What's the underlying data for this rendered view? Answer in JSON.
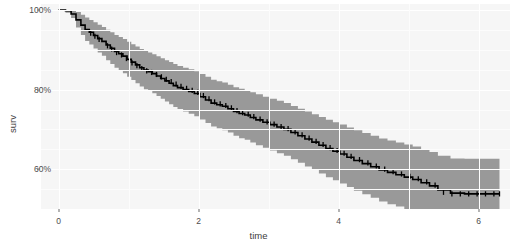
{
  "chart_data": {
    "type": "line",
    "subtype": "kaplan-meier-step-with-confidence-band",
    "title": "",
    "xlabel": "time",
    "ylabel": "surv",
    "xlim": [
      -0.25,
      6.45
    ],
    "ylim": [
      0.5,
      1.015
    ],
    "grid": true,
    "legend": null,
    "x_ticks": [
      0,
      2,
      4,
      6
    ],
    "x_tick_labels": [
      "0",
      "2",
      "4",
      "6"
    ],
    "y_ticks": [
      0.6,
      0.8,
      1.0
    ],
    "y_tick_labels": [
      "60%",
      "80%",
      "100%"
    ],
    "series": [
      {
        "name": "surv",
        "style": "step",
        "color": "#000000",
        "x": [
          0.0,
          0.1,
          0.18,
          0.25,
          0.32,
          0.38,
          0.44,
          0.5,
          0.56,
          0.62,
          0.68,
          0.74,
          0.8,
          0.86,
          0.92,
          0.98,
          1.04,
          1.1,
          1.16,
          1.22,
          1.28,
          1.34,
          1.4,
          1.46,
          1.52,
          1.58,
          1.64,
          1.7,
          1.78,
          1.86,
          1.94,
          2.02,
          2.1,
          2.18,
          2.26,
          2.34,
          2.42,
          2.5,
          2.58,
          2.66,
          2.74,
          2.82,
          2.92,
          3.02,
          3.12,
          3.22,
          3.32,
          3.42,
          3.52,
          3.62,
          3.72,
          3.82,
          3.92,
          4.02,
          4.12,
          4.22,
          4.34,
          4.46,
          4.58,
          4.7,
          4.82,
          4.94,
          5.06,
          5.18,
          5.3,
          5.42,
          5.6,
          5.8,
          6.0,
          6.2,
          6.3
        ],
        "y": [
          1.0,
          0.998,
          0.99,
          0.975,
          0.962,
          0.951,
          0.944,
          0.936,
          0.928,
          0.921,
          0.912,
          0.904,
          0.896,
          0.89,
          0.884,
          0.876,
          0.869,
          0.862,
          0.855,
          0.849,
          0.845,
          0.84,
          0.834,
          0.828,
          0.822,
          0.816,
          0.81,
          0.805,
          0.8,
          0.795,
          0.79,
          0.782,
          0.774,
          0.766,
          0.762,
          0.758,
          0.752,
          0.745,
          0.74,
          0.736,
          0.73,
          0.724,
          0.718,
          0.712,
          0.706,
          0.7,
          0.692,
          0.684,
          0.676,
          0.668,
          0.66,
          0.652,
          0.645,
          0.638,
          0.63,
          0.622,
          0.614,
          0.606,
          0.598,
          0.592,
          0.586,
          0.58,
          0.574,
          0.566,
          0.558,
          0.548,
          0.54,
          0.538,
          0.538,
          0.538,
          0.538
        ]
      }
    ],
    "confidence_band": {
      "name": "confidence interval",
      "color": "#999999",
      "opacity": 1.0,
      "x": [
        0.0,
        0.1,
        0.18,
        0.25,
        0.32,
        0.38,
        0.44,
        0.5,
        0.56,
        0.62,
        0.68,
        0.74,
        0.8,
        0.86,
        0.92,
        0.98,
        1.04,
        1.1,
        1.16,
        1.22,
        1.28,
        1.34,
        1.4,
        1.46,
        1.52,
        1.58,
        1.64,
        1.7,
        1.78,
        1.86,
        1.94,
        2.02,
        2.1,
        2.18,
        2.26,
        2.34,
        2.42,
        2.5,
        2.58,
        2.66,
        2.74,
        2.82,
        2.92,
        3.02,
        3.12,
        3.22,
        3.32,
        3.42,
        3.52,
        3.62,
        3.72,
        3.82,
        3.92,
        4.02,
        4.12,
        4.22,
        4.34,
        4.46,
        4.58,
        4.7,
        4.82,
        4.94,
        5.06,
        5.18,
        5.3,
        5.42,
        5.6,
        5.8,
        6.0,
        6.2,
        6.3
      ],
      "upper": [
        1.0,
        1.0,
        0.999,
        0.995,
        0.988,
        0.981,
        0.975,
        0.969,
        0.963,
        0.957,
        0.95,
        0.944,
        0.937,
        0.932,
        0.927,
        0.92,
        0.914,
        0.908,
        0.902,
        0.897,
        0.893,
        0.889,
        0.884,
        0.879,
        0.874,
        0.869,
        0.864,
        0.859,
        0.855,
        0.851,
        0.846,
        0.839,
        0.832,
        0.825,
        0.821,
        0.818,
        0.812,
        0.806,
        0.802,
        0.798,
        0.793,
        0.788,
        0.782,
        0.777,
        0.772,
        0.766,
        0.759,
        0.752,
        0.745,
        0.738,
        0.731,
        0.724,
        0.718,
        0.712,
        0.705,
        0.698,
        0.691,
        0.684,
        0.677,
        0.672,
        0.667,
        0.662,
        0.657,
        0.65,
        0.643,
        0.634,
        0.627,
        0.626,
        0.626,
        0.626,
        0.626
      ],
      "lower": [
        1.0,
        0.993,
        0.98,
        0.956,
        0.937,
        0.922,
        0.913,
        0.903,
        0.893,
        0.885,
        0.874,
        0.864,
        0.855,
        0.848,
        0.841,
        0.832,
        0.824,
        0.816,
        0.808,
        0.801,
        0.797,
        0.791,
        0.784,
        0.777,
        0.77,
        0.763,
        0.756,
        0.751,
        0.745,
        0.739,
        0.733,
        0.725,
        0.716,
        0.707,
        0.703,
        0.698,
        0.692,
        0.684,
        0.678,
        0.674,
        0.667,
        0.66,
        0.654,
        0.647,
        0.64,
        0.634,
        0.625,
        0.616,
        0.607,
        0.598,
        0.589,
        0.58,
        0.572,
        0.564,
        0.555,
        0.546,
        0.537,
        0.528,
        0.519,
        0.512,
        0.506,
        0.499,
        0.492,
        0.483,
        0.474,
        0.462,
        0.454,
        0.452,
        0.452,
        0.452,
        0.452
      ]
    },
    "censor_marks": {
      "name": "censoring ticks",
      "symbol": "plus",
      "color": "#000000",
      "x": [
        0.46,
        0.52,
        0.58,
        0.7,
        0.76,
        0.83,
        0.9,
        0.97,
        1.05,
        1.12,
        1.19,
        1.26,
        1.33,
        1.4,
        1.47,
        1.54,
        1.61,
        1.68,
        1.75,
        1.83,
        1.91,
        1.99,
        2.07,
        2.15,
        2.23,
        2.31,
        2.39,
        2.47,
        2.55,
        2.63,
        2.71,
        2.79,
        2.88,
        2.98,
        3.08,
        3.18,
        3.28,
        3.38,
        3.48,
        3.58,
        3.68,
        3.78,
        3.88,
        3.98,
        4.08,
        4.18,
        4.3,
        4.42,
        4.54,
        4.66,
        4.78,
        4.9,
        5.02,
        5.14,
        5.26,
        5.38,
        5.5,
        5.62,
        5.74,
        5.86,
        5.98,
        6.1,
        6.22,
        6.3
      ],
      "y": [
        0.942,
        0.934,
        0.926,
        0.91,
        0.902,
        0.893,
        0.887,
        0.878,
        0.867,
        0.86,
        0.853,
        0.847,
        0.843,
        0.838,
        0.832,
        0.826,
        0.82,
        0.814,
        0.808,
        0.803,
        0.798,
        0.793,
        0.785,
        0.777,
        0.769,
        0.764,
        0.76,
        0.754,
        0.747,
        0.742,
        0.738,
        0.732,
        0.726,
        0.719,
        0.713,
        0.707,
        0.702,
        0.694,
        0.686,
        0.678,
        0.67,
        0.662,
        0.654,
        0.647,
        0.64,
        0.632,
        0.624,
        0.616,
        0.608,
        0.6,
        0.594,
        0.588,
        0.582,
        0.576,
        0.568,
        0.56,
        0.542,
        0.538,
        0.538,
        0.538,
        0.538,
        0.538,
        0.538,
        0.538
      ]
    }
  },
  "axes": {
    "x_title": "time",
    "y_title": "surv",
    "x_tick_labels": [
      "0",
      "2",
      "4",
      "6"
    ],
    "y_tick_labels": [
      "60%",
      "80%",
      "100%"
    ]
  },
  "theme": {
    "panel_background": "#f6f6f6",
    "gridline_major_color": "#ffffff",
    "gridline_minor_color": "#fcfcfc",
    "line_color": "#000000",
    "band_color": "#999999",
    "axis_text_color": "#4d4d4d",
    "axis_title_color": "#3d3d3d",
    "page_background": "#ffffff"
  }
}
